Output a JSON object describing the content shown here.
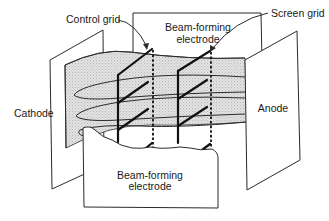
{
  "figure": {
    "labels": {
      "control_grid": "Control grid",
      "screen_grid": "Screen grid",
      "beam_forming_top_line1": "Beam-forming",
      "beam_forming_top_line2": "electrode",
      "cathode": "Cathode",
      "anode": "Anode",
      "beam_forming_bottom_line1": "Beam-forming",
      "beam_forming_bottom_line2": "electrode"
    },
    "colors": {
      "line": "#2a2a2a",
      "beam_shading": "#d9d9d9",
      "background": "#ffffff"
    }
  }
}
